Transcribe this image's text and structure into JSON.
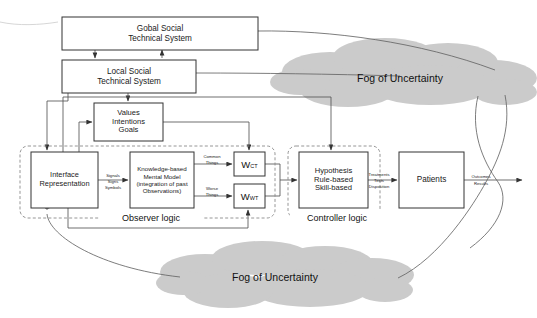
{
  "diagram": {
    "colors": {
      "box_stroke": "#333333",
      "box_fill": "#ffffff",
      "line": "#555555",
      "dashed_zone": "#888888",
      "cloud_fill": "#cccccc",
      "text": "#1a1a1a"
    },
    "boxes": [
      {
        "id": "global-social-technical-system",
        "label": "Gobal Social\nTechnical System",
        "x": 62,
        "y": 17,
        "w": 196,
        "h": 33,
        "font": 8.2
      },
      {
        "id": "local-social-technical-system",
        "label": "Local Social\nTechnical System",
        "x": 62,
        "y": 60,
        "w": 134,
        "h": 33,
        "font": 8.2
      },
      {
        "id": "values-intentions-goals",
        "label": "Values\nIntentions\nGoals",
        "x": 94,
        "y": 103,
        "w": 69,
        "h": 38,
        "font": 7.6
      },
      {
        "id": "interface-representation",
        "label": "Interface\nRepresentation",
        "x": 31,
        "y": 152,
        "w": 67,
        "h": 56,
        "font": 7.4
      },
      {
        "id": "knowledge-based-mental-model",
        "label": "Knowledge-based\nMental Model\n(integration of past\nObservations)",
        "x": 130,
        "y": 152,
        "w": 64,
        "h": 56,
        "font": 6.2
      },
      {
        "id": "hypothesis-rule-skill-based",
        "label": "Hypothesis\nRule-based\nSkill-based",
        "x": 299,
        "y": 152,
        "w": 69,
        "h": 56,
        "font": 7.6
      },
      {
        "id": "patients",
        "label": "Patients",
        "x": 399,
        "y": 152,
        "w": 65,
        "h": 56,
        "font": 8.2
      }
    ],
    "weight_boxes": [
      {
        "id": "w-common-things",
        "symbol": "W",
        "subscript": "CT",
        "x": 234,
        "y": 152,
        "w": 31,
        "h": 24
      },
      {
        "id": "w-worse-things",
        "symbol": "W",
        "subscript": "WT",
        "x": 234,
        "y": 184,
        "w": 31,
        "h": 24
      }
    ],
    "zones": [
      {
        "id": "observer-logic",
        "label": "Observer logic",
        "x": 20,
        "y": 146,
        "w": 255,
        "h": 72
      },
      {
        "id": "controller-logic",
        "label": "Controller logic",
        "x": 288,
        "y": 146,
        "w": 92,
        "h": 72
      }
    ],
    "clouds": [
      {
        "id": "fog-of-uncertainty-top",
        "label": "Fog of Uncertainty",
        "cx": 400,
        "cy": 78
      },
      {
        "id": "fog-of-uncertainty-bottom",
        "label": "Fog of Uncertainty",
        "cx": 275,
        "cy": 277
      }
    ],
    "edge_labels": [
      {
        "id": "signals-signs-symbols",
        "label": "Signals\nSigns\nSymbols",
        "x": 99,
        "y": 165,
        "w": 28,
        "h": 34
      },
      {
        "id": "common-things",
        "label": "Common\nThings",
        "x": 196,
        "y": 154,
        "w": 32,
        "h": 15
      },
      {
        "id": "worse-things",
        "label": "Worse\nThings",
        "x": 196,
        "y": 186,
        "w": 32,
        "h": 15
      },
      {
        "id": "treatments-tests-disposition",
        "label": "Treatments\nTests\nDisposition",
        "x": 363,
        "y": 166,
        "w": 32,
        "h": 30
      },
      {
        "id": "outcomes-results",
        "label": "Outcomes\nResults",
        "x": 464,
        "y": 170,
        "w": 32,
        "h": 21
      }
    ]
  }
}
